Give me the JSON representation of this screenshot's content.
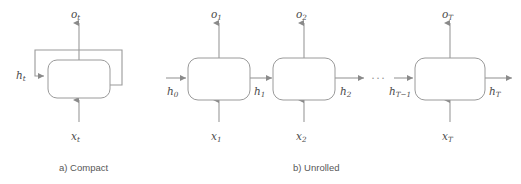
{
  "figure": {
    "background_color": "#ffffff",
    "line_color": "#9a9a9a",
    "text_color": "#4a4a4a",
    "panels": [
      {
        "id": "compact",
        "caption": "a) Compact",
        "labels": {
          "output": "o",
          "output_sub": "t",
          "hidden": "h",
          "hidden_sub": "t",
          "input": "x",
          "input_sub": "t"
        }
      },
      {
        "id": "unrolled",
        "caption": "b) Unrolled",
        "ellipsis": "···",
        "steps": [
          {
            "output": "o",
            "output_sub": "1",
            "hidden_in": "h",
            "hidden_in_sub": "0",
            "input": "x",
            "input_sub": "1"
          },
          {
            "output": "o",
            "output_sub": "2",
            "hidden_in": "h",
            "hidden_in_sub": "1",
            "input": "x",
            "input_sub": "2"
          },
          {
            "output": "o",
            "output_sub": "T",
            "hidden_in": "h",
            "hidden_in_sub": "T−1",
            "input": "x",
            "input_sub": "T"
          }
        ],
        "hidden_outputs": [
          {
            "label": "h",
            "sub": "1"
          },
          {
            "label": "h",
            "sub": "2"
          },
          {
            "label": "h",
            "sub": "T"
          }
        ]
      }
    ]
  }
}
